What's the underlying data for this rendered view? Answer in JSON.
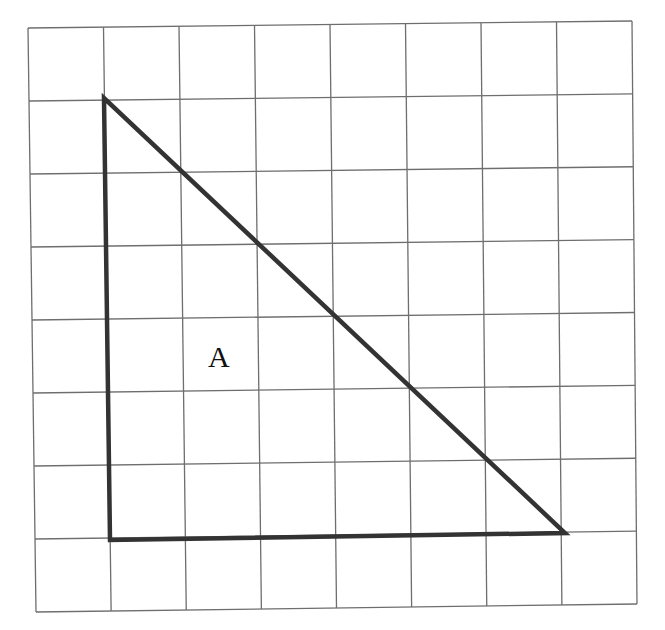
{
  "diagram": {
    "type": "grid-shape",
    "grid": {
      "columns": 8,
      "rows": 8,
      "origin": [
        28,
        28
      ],
      "cell_size": 75.5,
      "line_color": "#6e6e6e"
    },
    "shape": {
      "kind": "right-triangle",
      "label": "A",
      "stroke_color": "#333333",
      "vertices_grid_units": [
        [
          1,
          1
        ],
        [
          1,
          7
        ],
        [
          7,
          7
        ]
      ],
      "vertices_px": [
        [
          104,
          98
        ],
        [
          110,
          540
        ],
        [
          565,
          533
        ]
      ],
      "label_position_px": [
        220,
        367
      ]
    }
  }
}
